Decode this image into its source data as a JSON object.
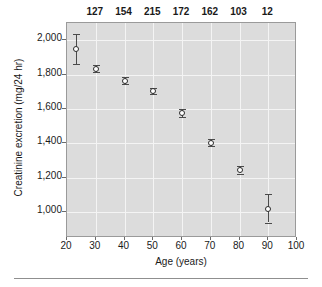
{
  "chart_data": {
    "type": "scatter",
    "title": "",
    "xlabel": "Age (years)",
    "ylabel": "Creatinine excretion (mg/24 hr)",
    "xlim": [
      20,
      100
    ],
    "ylim": [
      850,
      2100
    ],
    "xticks": [
      20,
      30,
      40,
      50,
      60,
      70,
      80,
      90,
      100
    ],
    "xtick_labels": [
      "20",
      "30",
      "40",
      "50",
      "60",
      "70",
      "80",
      "90",
      "100"
    ],
    "yticks": [
      1000,
      1200,
      1400,
      1600,
      1800,
      2000
    ],
    "ytick_labels": [
      "1,000",
      "1,200",
      "1,400",
      "1,600",
      "1,800",
      "2,000"
    ],
    "grid": true,
    "legend": "none",
    "marker": "open-circle",
    "errorbars": true,
    "annotation_header_label": "n",
    "x": [
      23,
      30,
      40,
      50,
      60,
      70,
      80,
      90
    ],
    "values": [
      1950,
      1835,
      1765,
      1705,
      1578,
      1405,
      1245,
      1020
    ],
    "error_low": [
      1860,
      1815,
      1745,
      1688,
      1555,
      1385,
      1225,
      940
    ],
    "error_high": [
      2035,
      1858,
      1788,
      1722,
      1602,
      1428,
      1268,
      1105
    ],
    "n_counts": [
      "",
      "127",
      "154",
      "215",
      "172",
      "162",
      "103",
      "12"
    ],
    "series": [
      {
        "name": "Creatinine excretion",
        "points": [
          {
            "age": 23,
            "mean": 1950,
            "low": 1860,
            "high": 2035,
            "n": ""
          },
          {
            "age": 30,
            "mean": 1835,
            "low": 1815,
            "high": 1858,
            "n": "127"
          },
          {
            "age": 40,
            "mean": 1765,
            "low": 1745,
            "high": 1788,
            "n": "154"
          },
          {
            "age": 50,
            "mean": 1705,
            "low": 1688,
            "high": 1722,
            "n": "215"
          },
          {
            "age": 60,
            "mean": 1578,
            "low": 1555,
            "high": 1602,
            "n": "172"
          },
          {
            "age": 70,
            "mean": 1405,
            "low": 1385,
            "high": 1428,
            "n": "162"
          },
          {
            "age": 80,
            "mean": 1245,
            "low": 1225,
            "high": 1268,
            "n": "103"
          },
          {
            "age": 90,
            "mean": 1020,
            "low": 940,
            "high": 1105,
            "n": "12"
          }
        ]
      }
    ],
    "colors": {
      "panel_background": "#dcdcdc",
      "gridline": "#f4f4f4",
      "marker_edge": "#2b2b2b",
      "marker_fill": "#ffffff",
      "errorbar": "#4a4a4a",
      "axis": "#6a6a6a",
      "text": "#1a1a1a",
      "page_background": "#ffffff"
    }
  }
}
